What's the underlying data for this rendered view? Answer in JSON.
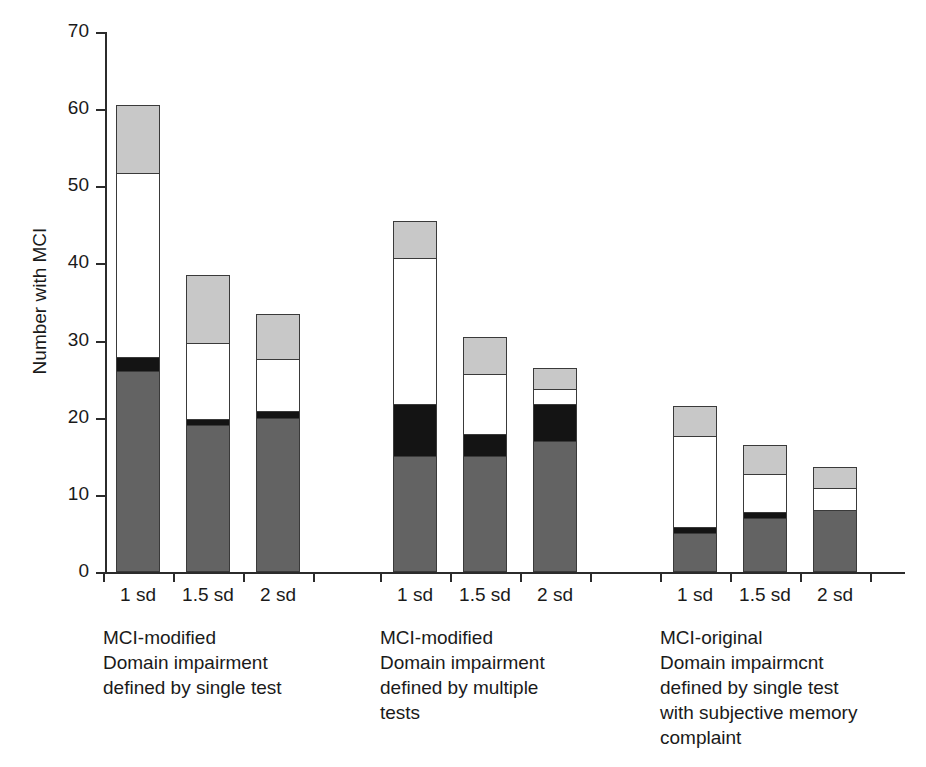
{
  "chart_data": {
    "type": "bar",
    "stacked": true,
    "title": "",
    "xlabel": "",
    "ylabel": "Number with MCI",
    "ylim": [
      0,
      70
    ],
    "ytick_values": [
      0,
      10,
      20,
      30,
      40,
      50,
      60,
      70
    ],
    "ytick_labels": [
      "0",
      "10",
      "20",
      "30",
      "40",
      "50",
      "60",
      "70"
    ],
    "grid": false,
    "legend": "none",
    "series": [
      {
        "name": "segment-1-dark-gray",
        "color": "#636363",
        "values": [
          26,
          19,
          20,
          15,
          15,
          17,
          5,
          7,
          8
        ]
      },
      {
        "name": "segment-2-black",
        "color": "#141414",
        "values": [
          2,
          1,
          1,
          7,
          3,
          5,
          1,
          1,
          0
        ]
      },
      {
        "name": "segment-3-white",
        "color": "#ffffff",
        "values": [
          24,
          10,
          7,
          19,
          8,
          2,
          12,
          5,
          3
        ]
      },
      {
        "name": "segment-4-light-gray",
        "color": "#c8c8c8",
        "values": [
          9,
          9,
          6,
          5,
          5,
          3,
          4,
          4,
          3
        ]
      }
    ],
    "categories": [
      "1 sd",
      "1.5 sd",
      "2 sd",
      "1 sd",
      "1.5 sd",
      "2 sd",
      "1 sd",
      "1.5 sd",
      "2 sd"
    ],
    "totals": [
      61,
      39,
      34,
      46,
      31,
      27,
      22,
      17,
      14
    ],
    "groups": [
      {
        "caption": "MCI-modified\nDomain impairment\ndefined by single test",
        "bars": [
          {
            "label": "1 sd",
            "total": 61,
            "segments": [
              26,
              2,
              24,
              9
            ]
          },
          {
            "label": "1.5 sd",
            "total": 39,
            "segments": [
              19,
              1,
              10,
              9
            ]
          },
          {
            "label": "2 sd",
            "total": 34,
            "segments": [
              20,
              1,
              7,
              6
            ]
          }
        ]
      },
      {
        "caption": "MCI-modified\nDomain impairment\ndefined by multiple\ntests",
        "bars": [
          {
            "label": "1 sd",
            "total": 46,
            "segments": [
              15,
              7,
              19,
              5
            ]
          },
          {
            "label": "1.5 sd",
            "total": 31,
            "segments": [
              15,
              3,
              8,
              5
            ]
          },
          {
            "label": "2 sd",
            "total": 27,
            "segments": [
              17,
              5,
              2,
              3
            ]
          }
        ]
      },
      {
        "caption": "MCI-original\nDomain impairmcnt\ndefined by single test\nwith subjective memory\ncomplaint",
        "bars": [
          {
            "label": "1 sd",
            "total": 22,
            "segments": [
              5,
              1,
              12,
              4
            ]
          },
          {
            "label": "1.5 sd",
            "total": 17,
            "segments": [
              7,
              1,
              5,
              4
            ]
          },
          {
            "label": "2 sd",
            "total": 14,
            "segments": [
              8,
              0,
              3,
              3
            ]
          }
        ]
      }
    ],
    "colors": {
      "dark_gray": "#636363",
      "black": "#141414",
      "white": "#ffffff",
      "light_gray": "#c8c8c8",
      "axis": "#2b2b2b",
      "outline": "#3a3a3a"
    }
  },
  "axis": {
    "y_title": "Number with MCI",
    "y_ticks": [
      "70",
      "60",
      "50",
      "40",
      "30",
      "20",
      "10",
      "0"
    ]
  },
  "captions": {
    "group1": "MCI-modified\nDomain impairment\ndefined by single test",
    "group2": "MCI-modified\nDomain impairment\ndefined by multiple\ntests",
    "group3": "MCI-original\nDomain impairmcnt\ndefined by single test\nwith subjective memory\ncomplaint"
  }
}
